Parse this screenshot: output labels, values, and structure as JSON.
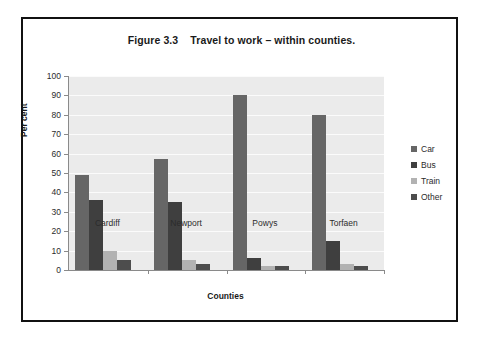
{
  "figure": {
    "title": "Figure 3.3    Travel to work – within counties."
  },
  "chart_data": {
    "type": "bar",
    "title": "Figure 3.3    Travel to work – within counties.",
    "xlabel": "Counties",
    "ylabel": "Per cent",
    "ylim": [
      0,
      100
    ],
    "ytick_step": 10,
    "ytick_labels": [
      "100",
      "90",
      "80",
      "70",
      "60",
      "50",
      "40",
      "30",
      "20",
      "10",
      "0"
    ],
    "grid": true,
    "grid_axis": "y",
    "legend_position": "right",
    "categories": [
      "Cardiff",
      "Newport",
      "Powys",
      "Torfaen"
    ],
    "series": [
      {
        "name": "Car",
        "color": "#666666",
        "values": [
          49,
          57,
          90,
          80
        ]
      },
      {
        "name": "Bus",
        "color": "#3f3f3f",
        "values": [
          36,
          35,
          6,
          15
        ]
      },
      {
        "name": "Train",
        "color": "#b2b2b2",
        "values": [
          10,
          5,
          2,
          3
        ]
      },
      {
        "name": "Other",
        "color": "#4d4d4d",
        "values": [
          5,
          3,
          2,
          2
        ]
      }
    ]
  }
}
